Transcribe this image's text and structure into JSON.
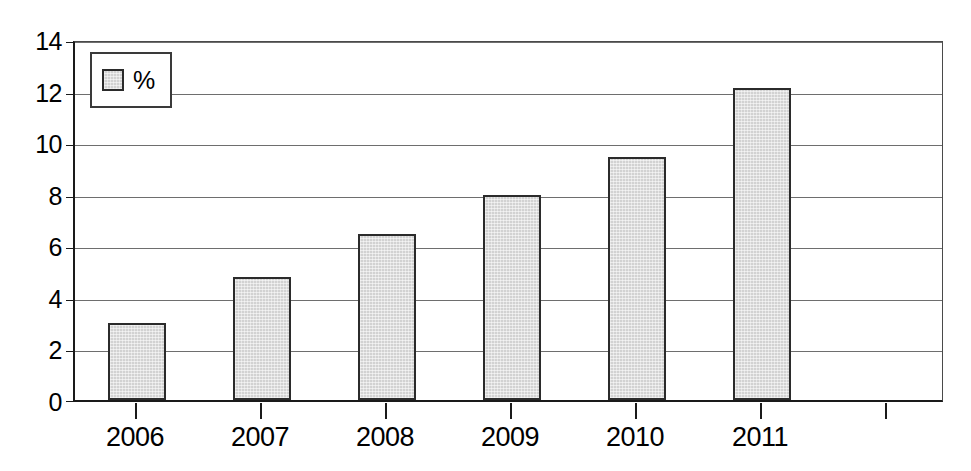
{
  "chart_data": {
    "type": "bar",
    "title": "",
    "subtitle": "",
    "xlabel": "",
    "ylabel": "",
    "categories": [
      "2006",
      "2007",
      "2008",
      "2009",
      "2010",
      "2011"
    ],
    "values": [
      3.0,
      4.8,
      6.5,
      8.0,
      9.5,
      12.2
    ],
    "series": [
      {
        "name": "%",
        "values": [
          3.0,
          4.8,
          6.5,
          8.0,
          9.5,
          12.2
        ]
      }
    ],
    "ylim": [
      0,
      14
    ],
    "yticks": [
      0,
      2,
      4,
      6,
      8,
      10,
      12,
      14
    ],
    "ytick_labels": [
      "0",
      "2",
      "4",
      "6",
      "8",
      "10",
      "12",
      "14"
    ],
    "grid": true,
    "grid_axis": "y",
    "legend": {
      "position": "top-left",
      "entries": [
        {
          "label": "%",
          "swatch_color": "#d2d2d2"
        }
      ]
    },
    "colors": {
      "bar_fill": "#d2d2d2",
      "bar_border": "#2b2b2b",
      "gridline": "#6e6e6e",
      "axis": "#1a1a1a",
      "background": "#ffffff",
      "text": "#000000"
    }
  }
}
